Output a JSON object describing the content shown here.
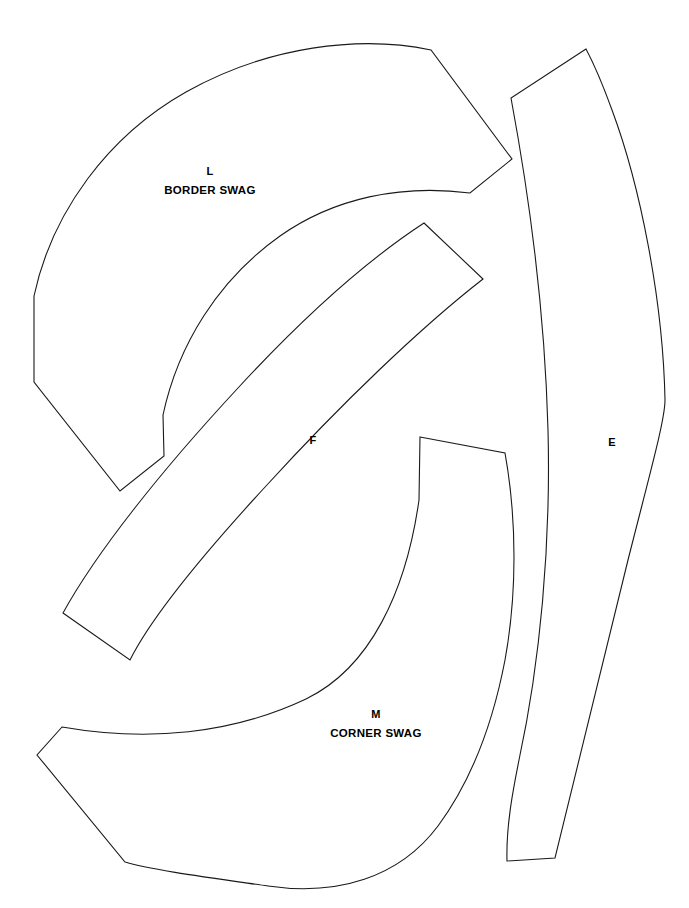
{
  "sheet": {
    "title": "Quilt Pattern Template Sheet",
    "background_color": "#ffffff",
    "line_color": "#1a1a1a",
    "text_color": "#000000",
    "width": 689,
    "height": 908
  },
  "pieces": [
    {
      "id": "L",
      "letter": "L",
      "name": "BORDER SWAG",
      "label_x": 210,
      "label_letter_y": 175,
      "label_name_y": 194,
      "path": "M 431 50 C 360 35 268 46 186 92 C 108 136 52 212 34 296 L 34 382 L 120 491 L 164 456 L 163 415 C 178 345 218 280 280 236 C 334 198 401 184 470 193 L 512 159 Z"
    },
    {
      "id": "F",
      "letter": "F",
      "name": "",
      "label_x": 313,
      "label_letter_y": 444,
      "label_name_y": 444,
      "path": "M 424 223 L 483 279 C 420 328 340 405 266 486 C 196 562 151 618 130 660 L 63 613 C 96 553 160 472 238 388 C 310 310 375 255 424 223 Z"
    },
    {
      "id": "M",
      "letter": "M",
      "name": "CORNER SWAG",
      "label_x": 376,
      "label_letter_y": 718,
      "label_name_y": 737,
      "path": "M 420 437 L 505 453 C 517 520 517 594 505 660 C 492 728 469 784 438 826 C 399 878 337 896 268 886 C 205 877 152 870 125 862 L 37 755 L 62 727 C 148 742 232 734 306 699 C 370 668 406 592 419 500 Z"
    },
    {
      "id": "E",
      "letter": "E",
      "name": "",
      "label_x": 612,
      "label_letter_y": 446,
      "label_name_y": 446,
      "path": "M 586 49 L 511 98 C 530 200 545 318 548 430 C 551 545 540 663 519 760 C 513 790 506 826 507 861 L 555 858 C 580 756 604 655 628 560 C 650 473 665 420 665 400 C 663 300 640 185 612 110 C 604 88 595 66 586 49 Z"
    }
  ],
  "labels": {
    "l_letter": "L",
    "l_name": "BORDER SWAG",
    "f_letter": "F",
    "m_letter": "M",
    "m_name": "CORNER SWAG",
    "e_letter": "E"
  }
}
